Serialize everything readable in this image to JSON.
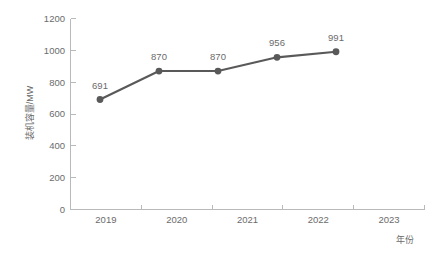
{
  "chart_data": {
    "type": "line",
    "title": "",
    "xlabel": "年份",
    "ylabel": "装机容量/MW",
    "categories": [
      "2019",
      "2020",
      "2021",
      "2022",
      "2023"
    ],
    "values": [
      691,
      870,
      870,
      956,
      991
    ],
    "point_labels": [
      "691",
      "870",
      "870",
      "956",
      "991"
    ],
    "ylim": [
      0,
      1200
    ],
    "y_ticks": [
      0,
      200,
      400,
      600,
      800,
      1000,
      1200
    ],
    "y_tick_labels": [
      "0",
      "200",
      "400",
      "600",
      "800",
      "1000",
      "1200"
    ],
    "x_tick_labels": [
      "2019",
      "2020",
      "2021",
      "2022",
      "2023"
    ],
    "grid": false,
    "legend": false,
    "legend_position": "none",
    "series_color": "#595959",
    "axis_color": "#b9b9b9",
    "label_color": "#6b6b6b",
    "background_color": "#ffffff",
    "marker": "circle",
    "marker_radius": 3.4,
    "line_width": 2.1
  }
}
